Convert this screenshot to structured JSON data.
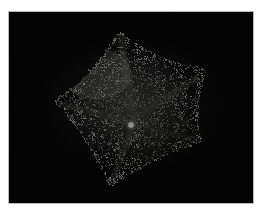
{
  "plate": {
    "kind": "photographic-plate",
    "background_color": "#ffffff",
    "frame_color": "#b9b9b7",
    "field_color": "#030303",
    "field_rect": {
      "x": 9,
      "y": 12,
      "width": 244,
      "height": 191
    }
  },
  "specimen": {
    "name": "sea-star",
    "common_description": "cushion sea star, aboral (dorsal) view",
    "arm_count": 5,
    "surface_texture": "dense granular tubercles / paxillae",
    "body_color_light": "#d8d8d4",
    "body_color_mid": "#9a9a96",
    "body_color_dark": "#3a3a38",
    "center": {
      "x": 128,
      "y": 112
    },
    "arm_tips": [
      {
        "label": "arm-tip-top",
        "x": 110,
        "y": 20
      },
      {
        "label": "arm-tip-upper-right",
        "x": 196,
        "y": 58
      },
      {
        "label": "arm-tip-lower-right",
        "x": 192,
        "y": 129
      },
      {
        "label": "arm-tip-bottom",
        "x": 101,
        "y": 174
      },
      {
        "label": "arm-tip-left",
        "x": 46,
        "y": 89
      }
    ],
    "madreporite": {
      "label": "madreporite",
      "x": 122,
      "y": 113,
      "radius": 3,
      "color": "#f6f6f2"
    }
  },
  "lighting": {
    "direction": "upper-left",
    "highlight_color": "#e6e6e2",
    "shadow_color": "#1c1c1a"
  }
}
